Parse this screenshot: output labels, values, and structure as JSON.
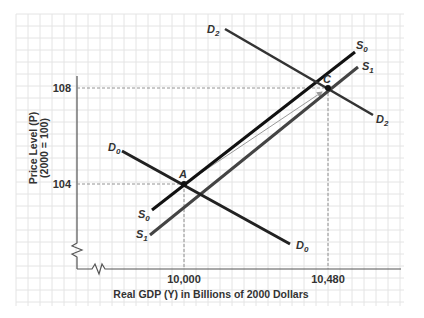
{
  "chart_data": {
    "type": "line",
    "title": "",
    "xlabel": "Real GDP (Y) in Billions of 2000 Dollars",
    "ylabel": "Price Level (P)",
    "ylabel_sub": "(2000 = 100)",
    "x_ticks": [
      "10,000",
      "10,480"
    ],
    "y_ticks": [
      "104",
      "108"
    ],
    "grid": true,
    "axis_breaks": {
      "x": true,
      "y": true
    },
    "series": [
      {
        "name": "D0",
        "kind": "aggregate demand",
        "points": [
          [
            9900,
            104.7
          ],
          [
            10350,
            102.8
          ]
        ]
      },
      {
        "name": "D2",
        "kind": "aggregate demand",
        "points": [
          [
            10130,
            111.2
          ],
          [
            10570,
            107.4
          ]
        ]
      },
      {
        "name": "S0",
        "kind": "aggregate supply",
        "points": [
          [
            9900,
            103.0
          ],
          [
            10550,
            109.8
          ]
        ]
      },
      {
        "name": "S1",
        "kind": "aggregate supply",
        "points": [
          [
            9900,
            102.1
          ],
          [
            10560,
            109.2
          ]
        ]
      }
    ],
    "points": [
      {
        "label": "A",
        "x": 10000,
        "y": 104
      },
      {
        "label": "C",
        "x": 10480,
        "y": 108
      }
    ],
    "annotations": [
      "Dashed guide lines from A to 10,000 and 104",
      "Dashed guide lines from C to 10,480 and 108",
      "Thin arrow from A to C"
    ]
  },
  "labels": {
    "y_axis_title": "Price Level (P)",
    "y_axis_sub": "(2000 = 100)",
    "x_axis_title": "Real GDP (Y) in Billions of 2000 Dollars",
    "tick_108": "108",
    "tick_104": "104",
    "tick_10000": "10,000",
    "tick_10480": "10,480",
    "point_a": "A",
    "point_c": "C",
    "curves": {
      "d0_main": "D",
      "d0_sub": "0",
      "d2_main": "D",
      "d2_sub": "2",
      "s0_main": "S",
      "s0_sub": "0",
      "s1_main": "S",
      "s1_sub": "1"
    }
  },
  "colors": {
    "grid": "#e4e4e4",
    "axis": "#555555",
    "demand": "#222222",
    "supply_s0": "#111111",
    "supply_s1": "#444444",
    "guide": "#888888",
    "arrow": "#9a9a9a"
  }
}
